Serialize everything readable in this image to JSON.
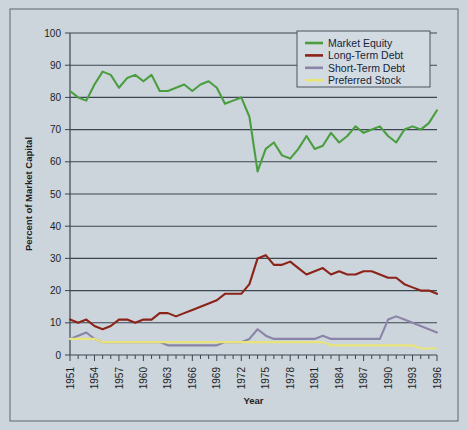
{
  "figure": {
    "background_color": "#ccd4dc",
    "border_color": "#5d6670"
  },
  "chart_data": {
    "type": "line",
    "title": "",
    "xlabel": "Year",
    "ylabel": "Percent of Market Capital",
    "xlim": [
      1951,
      1996
    ],
    "ylim": [
      0,
      100
    ],
    "ytick_step": 10,
    "yticks": [
      0,
      10,
      20,
      30,
      40,
      50,
      60,
      70,
      80,
      90,
      100
    ],
    "xticks": [
      1951,
      1954,
      1957,
      1960,
      1963,
      1966,
      1969,
      1972,
      1975,
      1978,
      1981,
      1984,
      1987,
      1990,
      1993,
      1996
    ],
    "xtick_minor_every": 1,
    "grid": "horizontal",
    "legend_position": "top-right",
    "x": [
      1951,
      1952,
      1953,
      1954,
      1955,
      1956,
      1957,
      1958,
      1959,
      1960,
      1961,
      1962,
      1963,
      1964,
      1965,
      1966,
      1967,
      1968,
      1969,
      1970,
      1971,
      1972,
      1973,
      1974,
      1975,
      1976,
      1977,
      1978,
      1979,
      1980,
      1981,
      1982,
      1983,
      1984,
      1985,
      1986,
      1987,
      1988,
      1989,
      1990,
      1991,
      1992,
      1993,
      1994,
      1995,
      1996
    ],
    "series": [
      {
        "name": "Market Equity",
        "color": "#4a9e3f",
        "values": [
          82,
          80,
          79,
          84,
          88,
          87,
          83,
          86,
          87,
          85,
          87,
          82,
          82,
          83,
          84,
          82,
          84,
          85,
          83,
          78,
          79,
          80,
          74,
          57,
          64,
          66,
          62,
          61,
          64,
          68,
          64,
          65,
          69,
          66,
          68,
          71,
          69,
          70,
          71,
          68,
          66,
          70,
          71,
          70,
          72,
          76
        ]
      },
      {
        "name": "Long-Term Debt",
        "color": "#8b2318",
        "values": [
          11,
          10,
          11,
          9,
          8,
          9,
          11,
          11,
          10,
          11,
          11,
          13,
          13,
          12,
          13,
          14,
          15,
          16,
          17,
          19,
          19,
          19,
          22,
          30,
          31,
          28,
          28,
          29,
          27,
          25,
          26,
          27,
          25,
          26,
          25,
          25,
          26,
          26,
          25,
          24,
          24,
          22,
          21,
          20,
          20,
          19
        ]
      },
      {
        "name": "Short-Term Debt",
        "color": "#8a84a8",
        "values": [
          5,
          6,
          7,
          5,
          4,
          4,
          4,
          4,
          4,
          4,
          4,
          4,
          3,
          3,
          3,
          3,
          3,
          3,
          3,
          4,
          4,
          4,
          5,
          8,
          6,
          5,
          5,
          5,
          5,
          5,
          5,
          6,
          5,
          5,
          5,
          5,
          5,
          5,
          5,
          11,
          12,
          11,
          10,
          9,
          8,
          7
        ]
      },
      {
        "name": "Preferred Stock",
        "color": "#e8e47a",
        "values": [
          5,
          5,
          5,
          5,
          4,
          4,
          4,
          4,
          4,
          4,
          4,
          4,
          4,
          4,
          4,
          4,
          4,
          4,
          4,
          4,
          4,
          4,
          4,
          4,
          4,
          4,
          4,
          4,
          4,
          4,
          4,
          4,
          3,
          3,
          3,
          3,
          3,
          3,
          3,
          3,
          3,
          3,
          3,
          2,
          2,
          2
        ]
      }
    ]
  }
}
